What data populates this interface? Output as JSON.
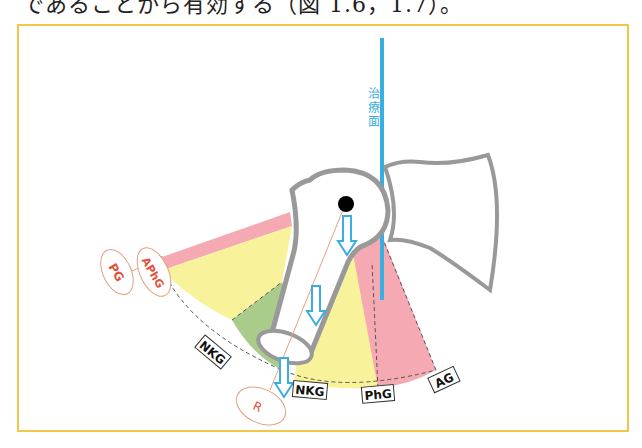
{
  "header": {
    "text": "であることから有効する（図 1.6，1.7）。"
  },
  "figure": {
    "frame_color": "#f3c64a",
    "treatment_plane_label": "治療面",
    "colors": {
      "pink": "#f4a9b3",
      "yellow": "#f8f39a",
      "green": "#a9cc8a",
      "bone_outline": "#999999",
      "plane": "#3aaee0",
      "circle_label": "#e4513a"
    },
    "circle_labels": [
      "PG",
      "APhG",
      "R"
    ],
    "box_labels": [
      "NKG",
      "NKG",
      "PhG",
      "AG"
    ]
  }
}
